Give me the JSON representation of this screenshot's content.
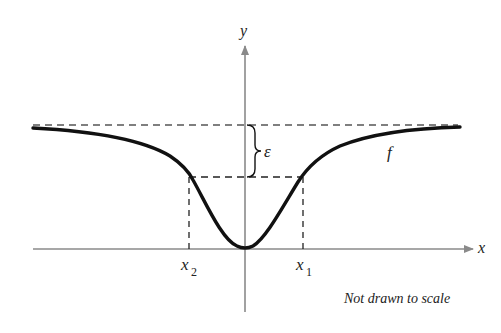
{
  "figure": {
    "caption": "Not drawn to scale",
    "curve_label": "f",
    "epsilon_label": "ε",
    "axes": {
      "x_label": "x",
      "y_label": "y"
    },
    "points": {
      "x1_label": "x",
      "x1_sub": "1",
      "x2_label": "x",
      "x2_sub": "2"
    }
  },
  "colors": {
    "curve": "#111111",
    "axis": "#8a8a8a",
    "dashed": "#555555",
    "text": "#222222"
  }
}
